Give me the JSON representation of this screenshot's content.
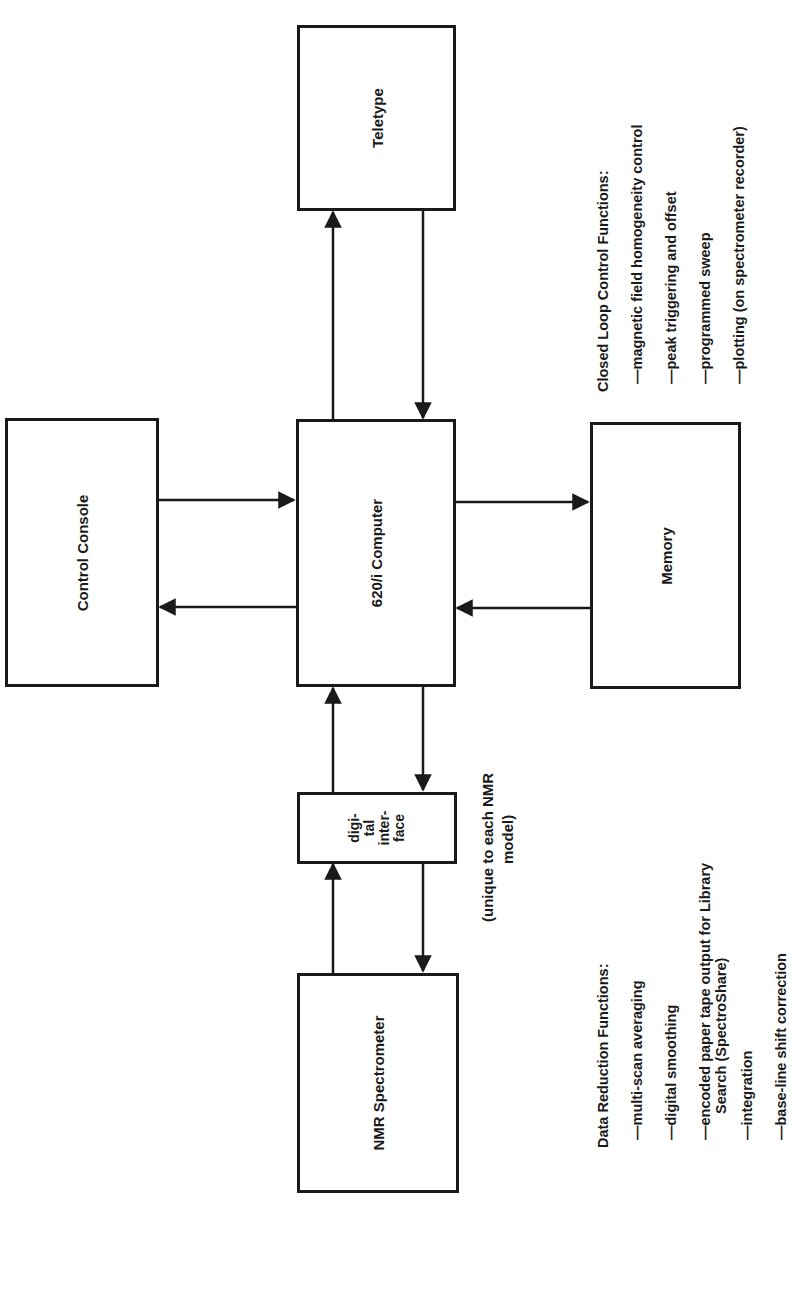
{
  "diagram": {
    "blocks": {
      "teletype": "Teletype",
      "control_console": "Control Console",
      "computer": "620/i Computer",
      "memory": "Memory",
      "digital_interface": [
        "digi-",
        "tal",
        "inter-",
        "face"
      ],
      "nmr_spectrometer": "NMR Spectrometer"
    },
    "interface_note": [
      "(unique to each NMR",
      "model)"
    ],
    "closed_loop": {
      "title": "Closed Loop Control Functions:",
      "items": [
        "—magnetic field homogeneity control",
        "—peak triggering and offset",
        "—programmed sweep",
        "—plotting (on spectrometer recorder)"
      ]
    },
    "data_reduction": {
      "title": "Data Reduction Functions:",
      "items": [
        "—multi-scan averaging",
        "—digital smoothing",
        "—encoded paper tape output for Library",
        "Search (SpectroShare)",
        "—integration",
        "—base-line shift correction"
      ]
    },
    "connections": [
      {
        "from": "620/i Computer",
        "to": "Teletype"
      },
      {
        "from": "Teletype",
        "to": "620/i Computer"
      },
      {
        "from": "Control Console",
        "to": "620/i Computer"
      },
      {
        "from": "620/i Computer",
        "to": "Control Console"
      },
      {
        "from": "620/i Computer",
        "to": "Memory"
      },
      {
        "from": "Memory",
        "to": "620/i Computer"
      },
      {
        "from": "digital interface",
        "to": "620/i Computer"
      },
      {
        "from": "620/i Computer",
        "to": "digital interface"
      },
      {
        "from": "NMR Spectrometer",
        "to": "digital interface"
      },
      {
        "from": "digital interface",
        "to": "NMR Spectrometer"
      }
    ]
  }
}
